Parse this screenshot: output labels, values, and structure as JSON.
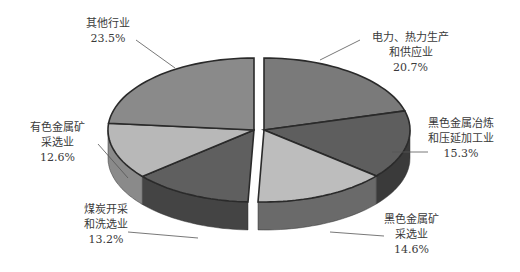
{
  "chart_data": {
    "type": "pie",
    "style": "3d-exploded-grayscale",
    "title": "",
    "legend": "none",
    "slices": [
      {
        "name": "电力、热力生产和供应业",
        "label_lines": [
          "电力、热力生产",
          "和供应业"
        ],
        "value": 20.7,
        "value_label": "20.7%",
        "color": "#7a7a7a",
        "side": "#5a5a5a"
      },
      {
        "name": "黑色金属冶炼和压延加工业",
        "label_lines": [
          "黑色金属冶炼",
          "和压延加工业"
        ],
        "value": 15.3,
        "value_label": "15.3%",
        "color": "#5e5e5e",
        "side": "#3a3a3a"
      },
      {
        "name": "黑色金属矿采选业",
        "label_lines": [
          "黑色金属矿",
          "采选业"
        ],
        "value": 14.6,
        "value_label": "14.6%",
        "color": "#bdbdbd",
        "side": "#6a6a6a"
      },
      {
        "name": "煤炭开采和洗选业",
        "label_lines": [
          "煤炭开采",
          "和洗选业"
        ],
        "value": 13.2,
        "value_label": "13.2%",
        "color": "#5f5f5f",
        "side": "#444444"
      },
      {
        "name": "有色金属矿采选业",
        "label_lines": [
          "有色金属矿",
          "采选业"
        ],
        "value": 12.6,
        "value_label": "12.6%",
        "color": "#b8b8b8",
        "side": "#8a8a8a"
      },
      {
        "name": "其他行业",
        "label_lines": [
          "其他行业"
        ],
        "value": 23.5,
        "value_label": "23.5%",
        "color": "#8a8a8a",
        "side": "#6a6a6a"
      }
    ]
  }
}
